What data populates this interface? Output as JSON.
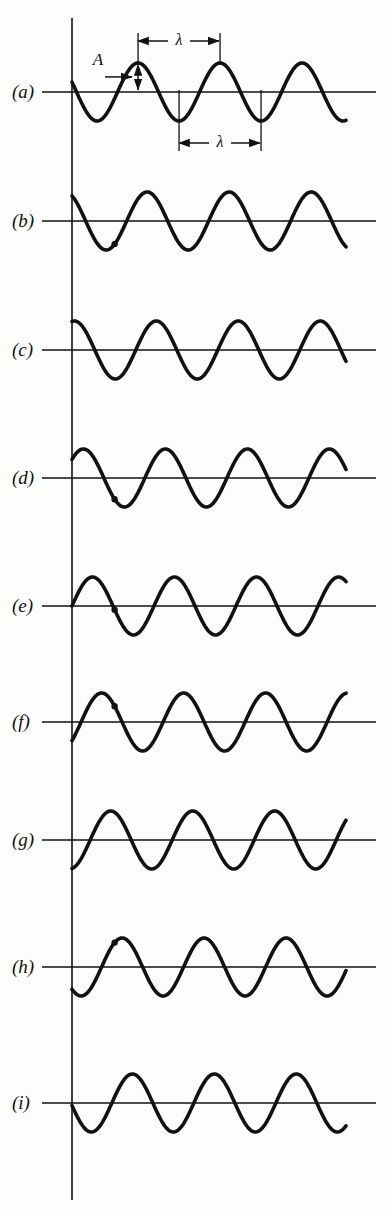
{
  "figure": {
    "background_color": "#fdfdfb",
    "ink_color": "#111111",
    "width": 391,
    "height": 1214
  },
  "annotations": {
    "amplitude_label": "A",
    "wavelength_label_top": "λ",
    "wavelength_label_bottom": "λ"
  },
  "panels": [
    {
      "label": "(a)",
      "baseline_y": 92,
      "phase_deg": 160
    },
    {
      "label": "(b)",
      "baseline_y": 221,
      "phase_deg": 120
    },
    {
      "label": "(c)",
      "baseline_y": 350,
      "phase_deg": 80
    },
    {
      "label": "(d)",
      "baseline_y": 478,
      "phase_deg": 40
    },
    {
      "label": "(e)",
      "baseline_y": 606,
      "phase_deg": 0
    },
    {
      "label": "(f)",
      "baseline_y": 722,
      "phase_deg": 320
    },
    {
      "label": "(g)",
      "baseline_y": 840,
      "phase_deg": 280
    },
    {
      "label": "(h)",
      "baseline_y": 967,
      "phase_deg": 230
    },
    {
      "label": "(i)",
      "baseline_y": 1103,
      "phase_deg": 185
    }
  ],
  "geometry": {
    "axis_x": 72,
    "wave_start_x": 72,
    "wave_end_x": 346,
    "baseline_start_x": 42,
    "baseline_end_x": 376,
    "amplitude_px": 29,
    "wavelength_px": 82,
    "vertical_axis_top": 18,
    "vertical_axis_bottom": 1200
  },
  "chart_data": {
    "type": "line",
    "xlabel": "",
    "ylabel": "",
    "grid": false,
    "legend": "none",
    "amplitude": 1.0,
    "wavelength": 1.0,
    "cycles_shown": 3.35,
    "series": [
      {
        "name": "(a)",
        "phase_deg": 160,
        "values_note": "y = A sin(2*pi*x/lambda + 160deg)"
      },
      {
        "name": "(b)",
        "phase_deg": 120,
        "values_note": "y = A sin(2*pi*x/lambda + 120deg)"
      },
      {
        "name": "(c)",
        "phase_deg": 80,
        "values_note": "y = A sin(2*pi*x/lambda + 80deg)"
      },
      {
        "name": "(d)",
        "phase_deg": 40,
        "values_note": "y = A sin(2*pi*x/lambda + 40deg)"
      },
      {
        "name": "(e)",
        "phase_deg": 0,
        "values_note": "y = A sin(2*pi*x/lambda + 0deg)"
      },
      {
        "name": "(f)",
        "phase_deg": 320,
        "values_note": "y = A sin(2*pi*x/lambda + 320deg)"
      },
      {
        "name": "(g)",
        "phase_deg": 280,
        "values_note": "y = A sin(2*pi*x/lambda + 280deg)"
      },
      {
        "name": "(h)",
        "phase_deg": 230,
        "values_note": "y = A sin(2*pi*x/lambda + 230deg)"
      },
      {
        "name": "(i)",
        "phase_deg": 185,
        "values_note": "y = A sin(2*pi*x/lambda + 185deg)"
      }
    ],
    "markers": {
      "description": "Small filled dots on panels (b), (d), (e), (f), (h) mark one particle of the medium, showing it moves only up and down as the wave advances.",
      "panels": [
        "(b)",
        "(d)",
        "(e)",
        "(f)",
        "(h)"
      ]
    }
  }
}
